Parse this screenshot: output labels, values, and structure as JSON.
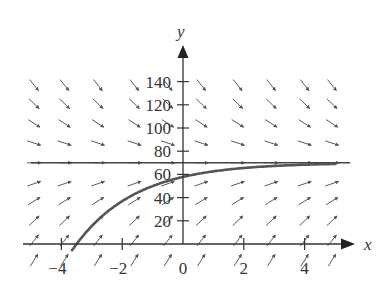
{
  "chart_data": {
    "type": "line",
    "title": "",
    "subtitle": "Slope field with solution curve",
    "xlabel": "x",
    "ylabel": "y",
    "xlim": [
      -5,
      5.5
    ],
    "ylim": [
      -20,
      170
    ],
    "x_ticks": [
      -4,
      -2,
      0,
      2,
      4
    ],
    "x_tick_labels": [
      "−4",
      "−2",
      "0",
      "2",
      "4"
    ],
    "y_ticks": [
      20,
      40,
      60,
      80,
      100,
      120,
      140
    ],
    "y_tick_labels": [
      "20",
      "40",
      "60",
      "80",
      "100",
      "120",
      "140"
    ],
    "grid": false,
    "legend": null,
    "slope_field": {
      "equation": "dy/dx = 0.5(70 - y)",
      "x_positions": [
        -4.9,
        -3.9,
        -2.8,
        -1.6,
        -0.5,
        0.6,
        1.8,
        2.9,
        4.0,
        4.9
      ],
      "y_positions": [
        -14,
        3,
        20,
        37,
        52,
        70,
        87,
        104,
        121,
        137
      ]
    },
    "series": [
      {
        "name": "equilibrium",
        "kind": "horizontal-line",
        "y": 70,
        "x": [
          -5,
          5.5
        ],
        "values": [
          70,
          70
        ]
      },
      {
        "name": "solution",
        "kind": "curve",
        "formula": "y = 70 - 70*exp(-0.5(x+3.5))",
        "x": [
          -3.65,
          -3.5,
          -3,
          -2.5,
          -2,
          -1.5,
          -1,
          -0.5,
          0,
          1,
          2,
          3,
          4,
          5
        ],
        "values": [
          -5.4,
          0,
          15.5,
          27.5,
          36.9,
          44.2,
          49.9,
          54.3,
          57.8,
          62.6,
          65.5,
          67.3,
          68.4,
          69.0
        ]
      }
    ]
  },
  "colors": {
    "axis": "#333333",
    "arrow": "#5a5a5a",
    "curve": "#555555",
    "equilibrium": "#444444"
  }
}
